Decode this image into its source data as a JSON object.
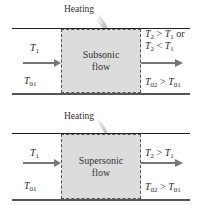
{
  "panels": [
    {
      "heating_label": "Heating",
      "box_label_line1": "Subsonic",
      "box_label_line2": "flow",
      "inlet": {
        "T": "T",
        "T_sub": "1",
        "T0": "T",
        "T0_sub": "01"
      },
      "outlet": {
        "line1": {
          "a": "T",
          "a_sub": "2",
          "op": " > ",
          "b": "T",
          "b_sub": "1",
          "suffix": " or"
        },
        "line2": {
          "a": "T",
          "a_sub": "2",
          "op": " < ",
          "b": "T",
          "b_sub": "1"
        },
        "stag": {
          "a": "T",
          "a_sub": "02",
          "op": " > ",
          "b": "T",
          "b_sub": "01"
        }
      }
    },
    {
      "heating_label": "Heating",
      "box_label_line1": "Supersonic",
      "box_label_line2": "flow",
      "inlet": {
        "T": "T",
        "T_sub": "1",
        "T0": "T",
        "T0_sub": "01"
      },
      "outlet": {
        "line1": {
          "a": "T",
          "a_sub": "2",
          "op": " > ",
          "b": "T",
          "b_sub": "1"
        },
        "stag": {
          "a": "T",
          "a_sub": "02",
          "op": " > ",
          "b": "T",
          "b_sub": "01"
        }
      }
    }
  ],
  "colors": {
    "box_fill": "#dcdcdc",
    "arrow": "#777777",
    "wall": "#222222"
  }
}
